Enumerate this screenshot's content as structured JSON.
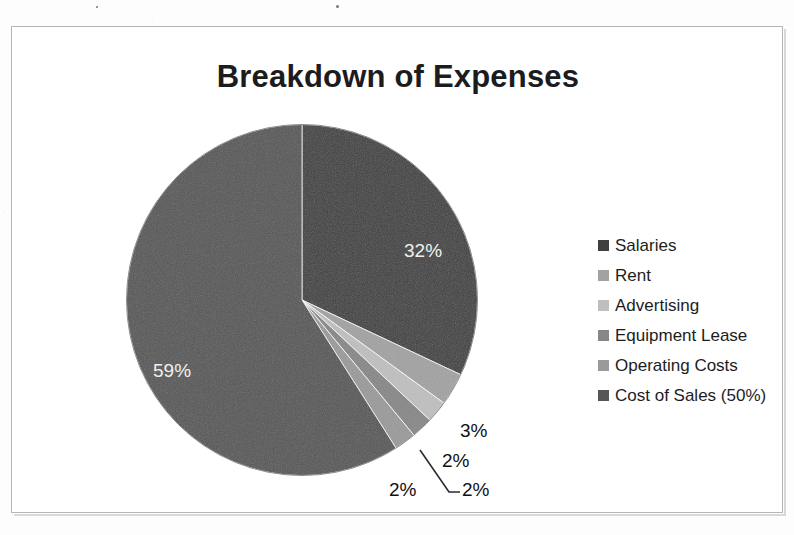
{
  "chart_data": {
    "type": "pie",
    "title": "Breakdown of Expenses",
    "categories": [
      "Salaries",
      "Rent",
      "Advertising",
      "Equipment Lease",
      "Operating Costs",
      "Cost of Sales (50%)"
    ],
    "values": [
      32,
      3,
      2,
      2,
      2,
      59
    ],
    "value_labels": [
      "32%",
      "3%",
      "2%",
      "2%",
      "2%",
      "59%"
    ],
    "colors": [
      "#3f3f3f",
      "#a2a2a2",
      "#bfbfbf",
      "#878787",
      "#9a9a9a",
      "#565656"
    ],
    "legend_position": "right",
    "grid": false,
    "start_angle_deg": 0,
    "direction": "clockwise",
    "xlabel": "",
    "ylabel": ""
  },
  "title": {
    "text": "Breakdown of Expenses"
  },
  "legend": {
    "items": [
      {
        "label": "Salaries",
        "color": "#3f3f3f"
      },
      {
        "label": "Rent",
        "color": "#a2a2a2"
      },
      {
        "label": "Advertising",
        "color": "#bfbfbf"
      },
      {
        "label": "Equipment Lease",
        "color": "#878787"
      },
      {
        "label": "Operating Costs",
        "color": "#9a9a9a"
      },
      {
        "label": "Cost of Sales (50%)",
        "color": "#565656"
      }
    ]
  },
  "data_labels": {
    "salaries": "32%",
    "cost_of_sales": "59%",
    "rent": "3%",
    "advertising": "2%",
    "equipment_lease": "2%",
    "operating_costs": "2%"
  }
}
